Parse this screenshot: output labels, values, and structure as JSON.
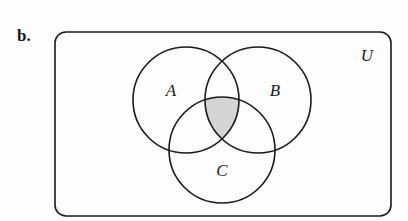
{
  "figure": {
    "part_label": "b.",
    "universe": {
      "label": "U",
      "rect": {
        "x": 55,
        "y": 32,
        "width": 336,
        "height": 184,
        "radius": 11
      }
    },
    "sets": [
      {
        "name": "A",
        "label": "A",
        "cx": 186,
        "cy": 100,
        "r": 53,
        "label_x": 171,
        "label_y": 96
      },
      {
        "name": "B",
        "label": "B",
        "cx": 258,
        "cy": 100,
        "r": 53,
        "label_x": 275,
        "label_y": 96
      },
      {
        "name": "C",
        "label": "C",
        "cx": 222,
        "cy": 150,
        "r": 53,
        "label_x": 222,
        "label_y": 176
      }
    ],
    "shaded_region": "A ∩ B ∩ C",
    "colors": {
      "stroke": "#1a1a1a",
      "shade": "#d4d4d4",
      "background": "#fdfdfd"
    }
  }
}
